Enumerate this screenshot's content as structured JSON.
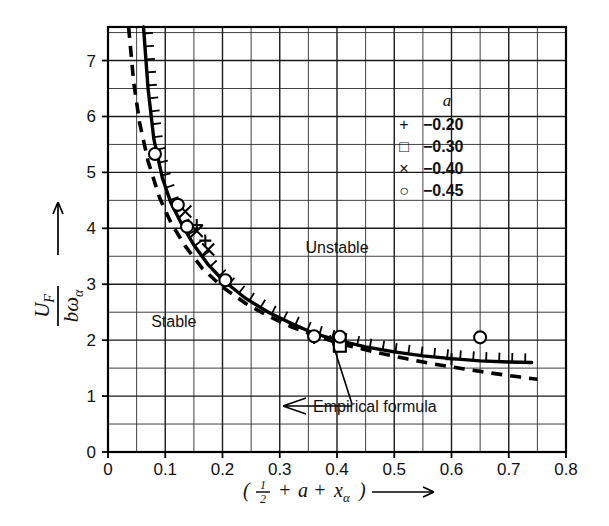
{
  "chart_data": {
    "type": "scatter",
    "title": "",
    "xlabel": "( 1/2 + a + x_alpha )",
    "ylabel": "U_F / (b w_alpha)",
    "xlim": [
      0,
      0.8
    ],
    "ylim": [
      0,
      7.6
    ],
    "xticks": [
      "0",
      "0.1",
      "0.2",
      "0.3",
      "0.4",
      "0.5",
      "0.6",
      "0.7",
      "0.8"
    ],
    "xtick_values": [
      0,
      0.1,
      0.2,
      0.3,
      0.4,
      0.5,
      0.6,
      0.7,
      0.8
    ],
    "yticks": [
      "0",
      "1",
      "2",
      "3",
      "4",
      "5",
      "6",
      "7"
    ],
    "ytick_values": [
      0,
      1,
      2,
      3,
      4,
      5,
      6,
      7
    ],
    "grid": true,
    "grid_minor_x_step": 0.05,
    "grid_minor_y_step": 0.5,
    "legend_position": "upper-right-inside",
    "series": [
      {
        "name": "-0.20",
        "symbol": "+",
        "points": [
          {
            "x": 0.155,
            "y": 4.06
          },
          {
            "x": 0.17,
            "y": 3.78
          },
          {
            "x": 0.36,
            "y": 2.04
          },
          {
            "x": 0.405,
            "y": 1.93
          },
          {
            "x": 0.6,
            "y": 1.66
          }
        ]
      },
      {
        "name": "-0.30",
        "symbol": "square",
        "points": [
          {
            "x": 0.405,
            "y": 1.9
          }
        ]
      },
      {
        "name": "-0.40",
        "symbol": "x",
        "points": [
          {
            "x": 0.135,
            "y": 4.3
          },
          {
            "x": 0.155,
            "y": 3.95
          },
          {
            "x": 0.175,
            "y": 3.62
          }
        ]
      },
      {
        "name": "-0.45",
        "symbol": "circle",
        "points": [
          {
            "x": 0.082,
            "y": 5.33
          },
          {
            "x": 0.122,
            "y": 4.42
          },
          {
            "x": 0.138,
            "y": 4.03
          },
          {
            "x": 0.205,
            "y": 3.07
          },
          {
            "x": 0.36,
            "y": 2.07
          },
          {
            "x": 0.405,
            "y": 2.06
          },
          {
            "x": 0.65,
            "y": 2.05
          }
        ]
      }
    ],
    "curves": [
      {
        "name": "flutter-boundary-solid",
        "style": "solid",
        "hatched": true,
        "hatch_side": "above",
        "points": [
          {
            "x": 0.062,
            "y": 7.6
          },
          {
            "x": 0.07,
            "y": 6.5
          },
          {
            "x": 0.08,
            "y": 5.6
          },
          {
            "x": 0.095,
            "y": 4.9
          },
          {
            "x": 0.11,
            "y": 4.45
          },
          {
            "x": 0.13,
            "y": 4.05
          },
          {
            "x": 0.15,
            "y": 3.7
          },
          {
            "x": 0.175,
            "y": 3.35
          },
          {
            "x": 0.2,
            "y": 3.08
          },
          {
            "x": 0.24,
            "y": 2.75
          },
          {
            "x": 0.28,
            "y": 2.5
          },
          {
            "x": 0.32,
            "y": 2.3
          },
          {
            "x": 0.36,
            "y": 2.12
          },
          {
            "x": 0.4,
            "y": 2.0
          },
          {
            "x": 0.45,
            "y": 1.88
          },
          {
            "x": 0.5,
            "y": 1.79
          },
          {
            "x": 0.55,
            "y": 1.72
          },
          {
            "x": 0.6,
            "y": 1.67
          },
          {
            "x": 0.65,
            "y": 1.63
          },
          {
            "x": 0.7,
            "y": 1.61
          },
          {
            "x": 0.74,
            "y": 1.6
          }
        ]
      },
      {
        "name": "empirical-formula-dashed",
        "style": "dashed",
        "points": [
          {
            "x": 0.036,
            "y": 7.6
          },
          {
            "x": 0.045,
            "y": 6.6
          },
          {
            "x": 0.055,
            "y": 5.9
          },
          {
            "x": 0.07,
            "y": 5.2
          },
          {
            "x": 0.09,
            "y": 4.55
          },
          {
            "x": 0.11,
            "y": 4.1
          },
          {
            "x": 0.135,
            "y": 3.68
          },
          {
            "x": 0.165,
            "y": 3.28
          },
          {
            "x": 0.2,
            "y": 2.95
          },
          {
            "x": 0.24,
            "y": 2.66
          },
          {
            "x": 0.28,
            "y": 2.43
          },
          {
            "x": 0.32,
            "y": 2.24
          },
          {
            "x": 0.37,
            "y": 2.05
          },
          {
            "x": 0.42,
            "y": 1.9
          },
          {
            "x": 0.47,
            "y": 1.78
          },
          {
            "x": 0.52,
            "y": 1.67
          },
          {
            "x": 0.57,
            "y": 1.57
          },
          {
            "x": 0.62,
            "y": 1.49
          },
          {
            "x": 0.67,
            "y": 1.41
          },
          {
            "x": 0.72,
            "y": 1.34
          },
          {
            "x": 0.75,
            "y": 1.3
          }
        ]
      }
    ],
    "annotations": [
      {
        "text": "Unstable",
        "x": 0.4,
        "y": 3.55
      },
      {
        "text": "Stable",
        "x": 0.115,
        "y": 2.23
      },
      {
        "text": "Empirical formula",
        "x": 0.475,
        "y": 1.0
      }
    ]
  },
  "axes": {
    "x_label_paren_open": "(",
    "x_label_half_num": "1",
    "x_label_half_den": "2",
    "x_label_plus_1": "+",
    "x_label_a": "a",
    "x_label_plus_2": "+",
    "x_label_x": "x",
    "x_label_x_sub": "α",
    "x_label_paren_close": ")",
    "y_label_num_main": "U",
    "y_label_num_sub": "F",
    "y_label_den_b": "b",
    "y_label_den_omega": "ω",
    "y_label_den_sub": "α"
  },
  "legend": {
    "title": "a",
    "entries": [
      {
        "symbol_name": "plus-marker",
        "symbol": "+",
        "value": "−0.20"
      },
      {
        "symbol_name": "square-marker",
        "symbol": "□",
        "value": "−0.30"
      },
      {
        "symbol_name": "cross-marker",
        "symbol": "×",
        "value": "−0.40"
      },
      {
        "symbol_name": "circle-marker",
        "symbol": "○",
        "value": "−0.45"
      }
    ]
  },
  "annotations": {
    "unstable": "Unstable",
    "stable": "Stable",
    "empirical": "Empirical formula"
  },
  "colors": {
    "ink": "#000000",
    "grid": "#2b2b2b",
    "background": "#ffffff"
  }
}
